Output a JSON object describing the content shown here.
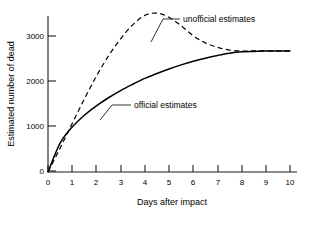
{
  "chart_data": {
    "type": "line",
    "title": "",
    "xlabel": "Days after impact",
    "ylabel": "Estimated number of dead",
    "xlim": [
      0,
      10.2
    ],
    "ylim": [
      0,
      3600
    ],
    "xticks": [
      "0",
      "1",
      "2",
      "3",
      "4",
      "5",
      "6",
      "7",
      "8",
      "9",
      "10"
    ],
    "yticks": [
      "0",
      "1000",
      "2000",
      "3000"
    ],
    "grid": false,
    "legend_position": "inline-annotations",
    "x": [
      0,
      0.5,
      1,
      1.5,
      2,
      2.5,
      3,
      3.5,
      4,
      4.5,
      5,
      5.5,
      6,
      6.5,
      7,
      7.5,
      8,
      8.5,
      9,
      9.5,
      10
    ],
    "series": [
      {
        "name": "official estimates",
        "style": "solid",
        "color": "#000000",
        "values": [
          0,
          640,
          1000,
          1260,
          1470,
          1650,
          1810,
          1950,
          2080,
          2190,
          2290,
          2380,
          2460,
          2530,
          2590,
          2640,
          2670,
          2680,
          2690,
          2690,
          2690
        ]
      },
      {
        "name": "unofficial estimates",
        "style": "dashed",
        "color": "#000000",
        "values": [
          0,
          530,
          1080,
          1620,
          2130,
          2580,
          2960,
          3270,
          3480,
          3530,
          3440,
          3250,
          3030,
          2870,
          2770,
          2710,
          2690,
          2690,
          2690,
          2690,
          2690
        ]
      }
    ],
    "annotations": [
      {
        "label": "unofficial estimates",
        "text_x": 183,
        "text_y": 22,
        "leader_from_x": 163,
        "leader_from_y": 19,
        "leader_to_x": 179,
        "leader_to_y": 19
      },
      {
        "label": "official estimates",
        "text_x": 134,
        "text_y": 108,
        "leader_from_x": 112,
        "leader_from_y": 105,
        "leader_to_x": 130,
        "leader_to_y": 105
      }
    ]
  },
  "axes": {
    "x_axis_title": "Days after impact",
    "y_axis_title": "Estimated number of dead",
    "x_tick_labels": [
      "0",
      "1",
      "2",
      "3",
      "4",
      "5",
      "6",
      "7",
      "8",
      "9",
      "10"
    ],
    "y_tick_labels": [
      "0",
      "1000",
      "2000",
      "3000"
    ]
  },
  "series_labels": {
    "unofficial": "unofficial estimates",
    "official": "official estimates"
  },
  "colors": {
    "axis": "#1a1a1a",
    "curve": "#000000",
    "background": "#ffffff"
  }
}
